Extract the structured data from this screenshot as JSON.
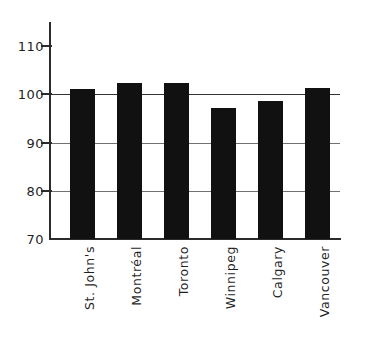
{
  "chart_data": {
    "type": "bar",
    "title": "",
    "subtitle": "",
    "xlabel": "",
    "ylabel": "",
    "categories": [
      "St. John's",
      "Montréal",
      "Toronto",
      "Winnipeg",
      "Calgary",
      "Vancouver"
    ],
    "values": [
      99.0,
      100.1,
      100.1,
      95.4,
      96.7,
      99.3
    ],
    "series": [
      {
        "name": "index",
        "values": [
          99.0,
          100.1,
          100.1,
          95.4,
          96.7,
          99.3
        ]
      }
    ],
    "ylim": [
      70,
      112
    ],
    "yticks": [
      70,
      80,
      90,
      100,
      110
    ],
    "ytick_labels": [
      "70",
      "80",
      "90",
      "100",
      "110"
    ],
    "gridlines_at": [
      80,
      90,
      100
    ],
    "grid": true,
    "legend": null,
    "legend_position": "none",
    "bar_color": "#111111",
    "axis_color": "#2b2b2b",
    "grid_color": "#3a3a3a",
    "background": "#ffffff",
    "xtick_label_rotation": "-90",
    "annotations": []
  }
}
